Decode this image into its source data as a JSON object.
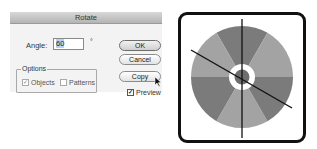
{
  "dialog": {
    "title": "Rotate",
    "angle_label": "Angle:",
    "angle_value": "60",
    "degree_symbol": "°",
    "options": {
      "legend": "Options",
      "objects": {
        "label": "Objects",
        "checked": true
      },
      "patterns": {
        "label": "Patterns",
        "checked": false
      }
    },
    "buttons": {
      "ok": "OK",
      "cancel": "Cancel",
      "copy": "Copy"
    },
    "preview": {
      "label": "Preview",
      "checked": true
    }
  },
  "artwork": {
    "description": "disk divided into six alternating gray wedges with a white ring in the center, a vertical line and a rotated line through the center",
    "colors": {
      "dark_wedge": "#7b7b7b",
      "light_wedge": "#a3a3a3",
      "ring": "#ffffff",
      "frame": "#111111",
      "lines": "#111111"
    }
  }
}
